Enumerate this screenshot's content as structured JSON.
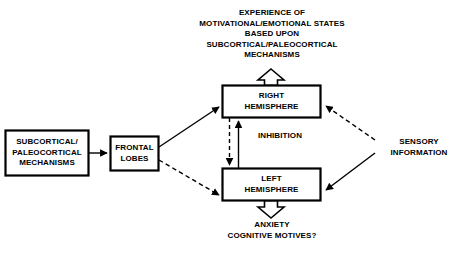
{
  "figure": {
    "background_color": "#ffffff",
    "stroke_color": "#000000",
    "top_caption": "EXPERIENCE OF\nMOTIVATIONAL/EMOTIONAL STATES\nBASED UPON\nSUBCORTICAL/PALEOCORTICAL\nMECHANISMS",
    "bottom_caption": "ANXIETY\nCOGNITIVE MOTIVES?",
    "sensory_caption": "SENSORY\nINFORMATION",
    "inhibition_label": "INHIBITION"
  },
  "boxes": {
    "subcortical": {
      "label": "SUBCORTICAL/\nPALEOCORTICAL\nMECHANISMS"
    },
    "frontal": {
      "label": "FRONTAL\nLOBES"
    },
    "right_hemisphere": {
      "label": "RIGHT\nHEMISPHERE"
    },
    "left_hemisphere": {
      "label": "LEFT\nHEMISPHERE"
    }
  },
  "connections": [
    {
      "name": "subcortical-to-frontal",
      "style": "solid",
      "from": "subcortical",
      "to": "frontal"
    },
    {
      "name": "frontal-to-right-hemisphere",
      "style": "solid",
      "from": "frontal",
      "to": "right_hemisphere"
    },
    {
      "name": "frontal-to-left-hemisphere",
      "style": "dashed",
      "from": "frontal",
      "to": "left_hemisphere"
    },
    {
      "name": "right-to-left-inhibition",
      "style": "dashed",
      "from": "right_hemisphere",
      "to": "left_hemisphere"
    },
    {
      "name": "left-to-right-inhibition",
      "style": "solid",
      "from": "left_hemisphere",
      "to": "right_hemisphere"
    },
    {
      "name": "sensory-to-right-hemisphere",
      "style": "dashed",
      "from": "sensory_information",
      "to": "right_hemisphere"
    },
    {
      "name": "sensory-to-left-hemisphere",
      "style": "solid",
      "from": "sensory_information",
      "to": "left_hemisphere"
    },
    {
      "name": "right-hemisphere-to-experience",
      "style": "hollow",
      "from": "right_hemisphere",
      "to": "top_caption"
    },
    {
      "name": "left-hemisphere-to-outcomes",
      "style": "hollow",
      "from": "left_hemisphere",
      "to": "bottom_caption"
    }
  ]
}
